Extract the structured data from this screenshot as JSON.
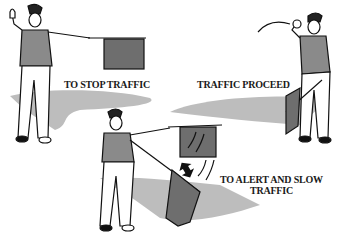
{
  "colors": {
    "shadow": "#bdbdbd",
    "flag": "#6e6e6e",
    "vest": "#8a8a8a",
    "outline": "#111111",
    "background": "#ffffff"
  },
  "panels": [
    {
      "id": "stop",
      "caption": "TO STOP TRAFFIC",
      "figure": "flagger holding flag horizontally, free hand raised palm out"
    },
    {
      "id": "proceed",
      "caption": "TRAFFIC PROCEED",
      "figure": "flagger with flag lowered, free arm waving traffic on"
    },
    {
      "id": "alert",
      "caption_line1": "TO ALERT AND SLOW",
      "caption_line2": "TRAFFIC",
      "figure": "flagger waving flag up and down",
      "motion_icon": "double-arrow-icon"
    }
  ]
}
